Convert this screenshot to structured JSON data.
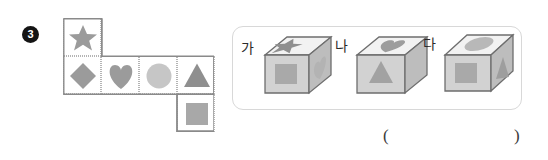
{
  "question": {
    "number": "3"
  },
  "net": {
    "caption": "cube-net",
    "cells": [
      {
        "id": "net-cell-star",
        "shape": "star",
        "col": 0,
        "row": 0,
        "color": "#9b9b9b"
      },
      {
        "id": "net-cell-diamond",
        "shape": "diamond",
        "col": 0,
        "row": 1,
        "color": "#9b9b9b"
      },
      {
        "id": "net-cell-heart",
        "shape": "heart",
        "col": 1,
        "row": 1,
        "color": "#9b9b9b"
      },
      {
        "id": "net-cell-circle",
        "shape": "circle",
        "col": 2,
        "row": 1,
        "color": "#c6c6c6"
      },
      {
        "id": "net-cell-triangle",
        "shape": "triangle",
        "col": 3,
        "row": 1,
        "color": "#8f8f8f"
      },
      {
        "id": "net-cell-square",
        "shape": "square",
        "col": 3,
        "row": 2,
        "color": "#a8a8a8"
      }
    ]
  },
  "choices": [
    {
      "label": "가",
      "top_shape": "star",
      "front_shape": "square",
      "side_shape": "heart",
      "top_color": "#8f8f8f",
      "front_color": "#a9a9a9",
      "side_color": "#b3b3b3"
    },
    {
      "label": "나",
      "top_shape": "heart",
      "front_shape": "triangle",
      "side_shape": "none",
      "top_color": "#9d9d9d",
      "front_color": "#a2a2a2",
      "side_color": "#b3b3b3"
    },
    {
      "label": "다",
      "top_shape": "circle",
      "front_shape": "square",
      "side_shape": "triangle",
      "top_color": "#b8b8b8",
      "front_color": "#a9a9a9",
      "side_color": "#9e9e9e"
    }
  ],
  "answer_field": {
    "open_paren": "(",
    "close_paren": ")",
    "value": ""
  },
  "colors": {
    "net_border": "#8a8a8a",
    "net_dotted": "#bdbdbd",
    "panel_border": "#d8d8d8",
    "cube_stroke": "#6e6e6e",
    "cube_front": "#cfcfcf",
    "cube_top": "#f2f2f2",
    "cube_side": "#bdbdbd",
    "text": "#2b2b2b"
  }
}
